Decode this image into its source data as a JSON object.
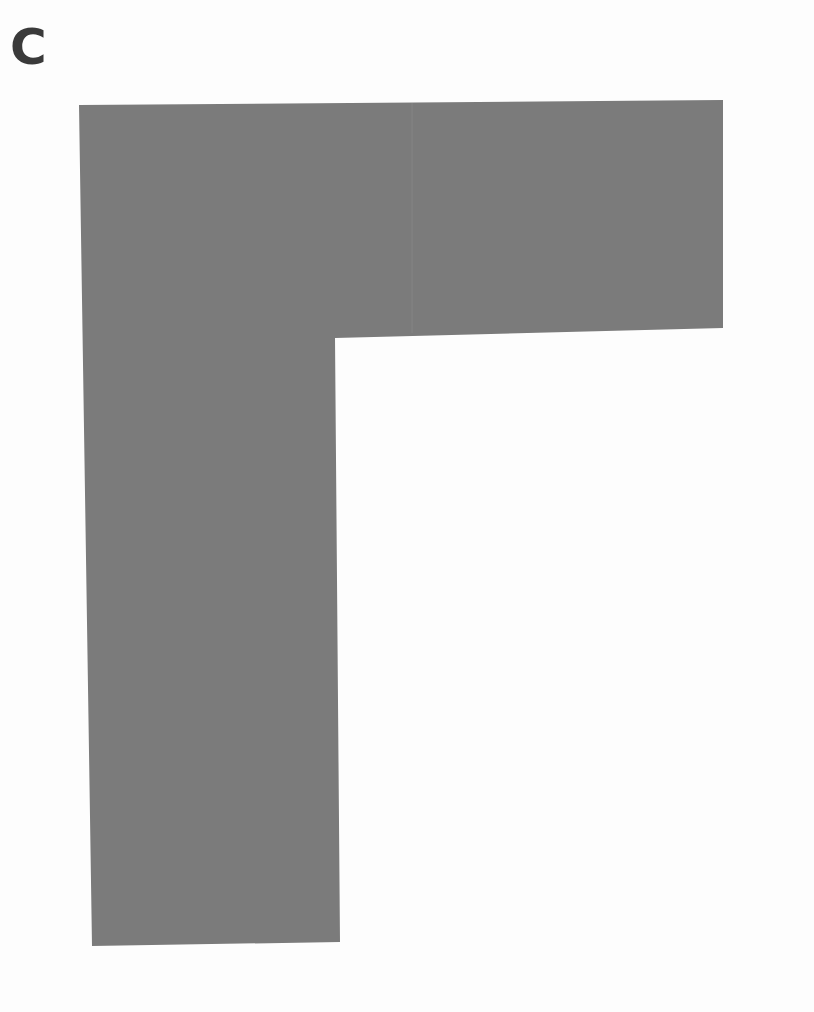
{
  "panel": {
    "label": "C"
  },
  "shape": {
    "type": "L-shape",
    "fill_color": "#7b7b7b",
    "background_color": "#fdfdfd",
    "points": [
      [
        79,
        105
      ],
      [
        723,
        100
      ],
      [
        723,
        328
      ],
      [
        335,
        338
      ],
      [
        340,
        942
      ],
      [
        92,
        946
      ]
    ]
  }
}
